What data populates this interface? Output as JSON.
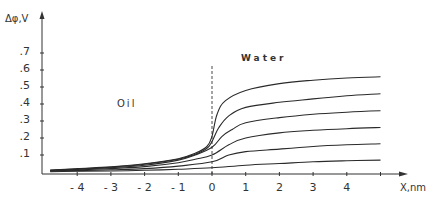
{
  "chart_data": {
    "type": "line",
    "title": "",
    "xlabel": "x, nm",
    "ylabel": "Δφ, V",
    "xlim": [
      -4.8,
      5.6
    ],
    "ylim": [
      0,
      0.8
    ],
    "grid": false,
    "legend": null,
    "x_ticks": [
      -4,
      -3,
      -2,
      -1,
      0,
      1,
      2,
      3,
      4
    ],
    "x_tick_labels": [
      "- 4",
      "- 3",
      "- 2",
      "- 1",
      "0",
      "1",
      "2",
      "3",
      "4"
    ],
    "y_ticks": [
      0.1,
      0.2,
      0.3,
      0.4,
      0.5,
      0.6,
      0.7
    ],
    "y_tick_labels": [
      ".1",
      ".2",
      ".3",
      ".4",
      ".5",
      ".6",
      ".7"
    ],
    "annotations": [
      {
        "text": "Oil",
        "x": -2.8,
        "y": 0.4
      },
      {
        "text": "Water",
        "x": 1.0,
        "y": 0.67
      },
      {
        "text": "interface (dashed line)",
        "x": 0,
        "y": 0.6
      }
    ],
    "series": [
      {
        "name": "curve 1",
        "x": [
          -4.8,
          -4,
          -3,
          -2,
          -1,
          -0.5,
          -0.15,
          0,
          0.15,
          0.4,
          1,
          2,
          3,
          4,
          5
        ],
        "values": [
          0.012,
          0.02,
          0.03,
          0.048,
          0.078,
          0.11,
          0.15,
          0.21,
          0.34,
          0.42,
          0.48,
          0.52,
          0.54,
          0.553,
          0.56
        ]
      },
      {
        "name": "curve 2",
        "x": [
          -4.8,
          -4,
          -3,
          -2,
          -1,
          -0.5,
          -0.15,
          0,
          0.2,
          0.5,
          1,
          2,
          3,
          4,
          5
        ],
        "values": [
          0.01,
          0.018,
          0.028,
          0.045,
          0.075,
          0.105,
          0.14,
          0.18,
          0.26,
          0.33,
          0.38,
          0.41,
          0.43,
          0.448,
          0.46
        ]
      },
      {
        "name": "curve 3",
        "x": [
          -4.8,
          -4,
          -3,
          -2,
          -1,
          -0.5,
          0,
          0.3,
          0.6,
          1,
          2,
          3,
          4,
          5
        ],
        "values": [
          0.008,
          0.015,
          0.025,
          0.04,
          0.07,
          0.1,
          0.145,
          0.21,
          0.25,
          0.29,
          0.32,
          0.34,
          0.352,
          0.36
        ]
      },
      {
        "name": "curve 4",
        "x": [
          -4.8,
          -4,
          -3,
          -2,
          -1,
          -0.5,
          0,
          0.5,
          1,
          2,
          3,
          4,
          5
        ],
        "values": [
          0.006,
          0.012,
          0.02,
          0.032,
          0.055,
          0.075,
          0.1,
          0.16,
          0.2,
          0.23,
          0.245,
          0.255,
          0.262
        ]
      },
      {
        "name": "curve 5",
        "x": [
          -4.8,
          -4,
          -3,
          -2,
          -1,
          0,
          0.5,
          1,
          2,
          3,
          4,
          5
        ],
        "values": [
          0.004,
          0.008,
          0.013,
          0.02,
          0.035,
          0.06,
          0.1,
          0.12,
          0.135,
          0.15,
          0.16,
          0.166
        ]
      },
      {
        "name": "curve 6",
        "x": [
          -4.8,
          -4,
          -3,
          -2,
          -1,
          0,
          1,
          2,
          3,
          4,
          5
        ],
        "values": [
          0.002,
          0.004,
          0.006,
          0.01,
          0.016,
          0.025,
          0.04,
          0.05,
          0.06,
          0.066,
          0.07
        ]
      }
    ]
  },
  "labels": {
    "y_axis": "Δφ,V",
    "x_axis": "X,nm",
    "oil": "Oil",
    "water": "Water"
  },
  "colors": {
    "line": "#2a2a2a",
    "axis": "#333333",
    "background": "#ffffff"
  }
}
